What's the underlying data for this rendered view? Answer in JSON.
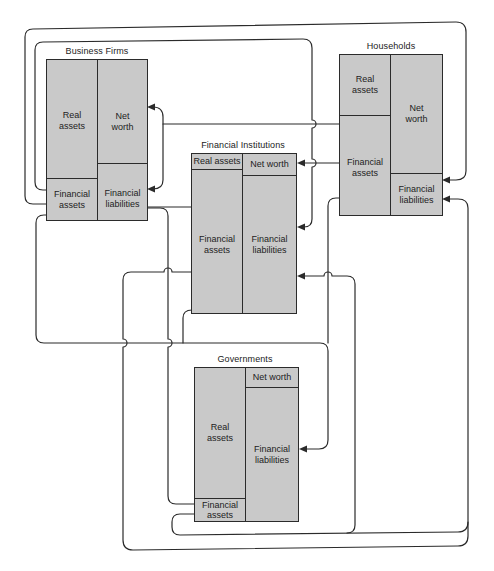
{
  "diagram": {
    "colors": {
      "background": "#ffffff",
      "cell_fill": "#c9c9c9",
      "line": "#2b2b2b"
    },
    "sectors": {
      "business_firms": {
        "title": "Business Firms",
        "cells": {
          "real_assets": "Real\nassets",
          "net_worth": "Net\nworth",
          "financial_assets": "Financial\nassets",
          "financial_liabilities": "Financial\nliabilities"
        }
      },
      "households": {
        "title": "Households",
        "cells": {
          "real_assets": "Real\nassets",
          "net_worth": "Net\nworth",
          "financial_assets": "Financial\nassets",
          "financial_liabilities": "Financial\nliabilities"
        }
      },
      "financial_institutions": {
        "title": "Financial Institutions",
        "cells": {
          "real_assets": "Real assets",
          "net_worth": "Net worth",
          "financial_assets": "Financial\nassets",
          "financial_liabilities": "Financial\nliabilities"
        }
      },
      "governments": {
        "title": "Governments",
        "cells": {
          "real_assets": "Real\nassets",
          "net_worth": "Net worth",
          "financial_assets": "Financial\nassets",
          "financial_liabilities": "Financial\nliabilities"
        }
      }
    },
    "flows": [
      {
        "from": "Business Firms: Financial assets",
        "to": "Households: Financial liabilities"
      },
      {
        "from": "Business Firms: Financial assets",
        "to": "Financial Institutions: Financial liabilities"
      },
      {
        "from": "Households: Financial assets",
        "to": "Business Firms: Net worth"
      },
      {
        "from": "Households: Financial assets",
        "to": "Business Firms: Financial liabilities"
      },
      {
        "from": "Households: Financial assets",
        "to": "Financial Institutions: Net worth"
      },
      {
        "from": "Households: Financial assets",
        "to": "Governments: Financial liabilities"
      },
      {
        "from": "Business Firms: Financial assets",
        "to": "Governments: Financial liabilities"
      },
      {
        "from": "Financial Institutions: Financial assets",
        "to": "Governments: Financial liabilities"
      },
      {
        "from": "Financial Institutions: Financial assets",
        "to": "Business Firms: Financial liabilities"
      },
      {
        "from": "Financial Institutions: Financial assets",
        "to": "Households: Financial liabilities"
      },
      {
        "from": "Governments: Financial assets",
        "to": "Business Firms: Financial liabilities"
      },
      {
        "from": "Governments: Financial assets",
        "to": "Households: Financial liabilities"
      },
      {
        "from": "Governments: Financial assets",
        "to": "Financial Institutions: Financial liabilities"
      }
    ]
  }
}
